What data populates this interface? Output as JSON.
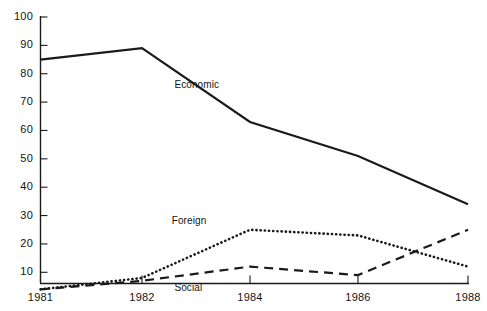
{
  "chart_data": {
    "type": "line",
    "title": "",
    "xlabel": "",
    "ylabel": "",
    "x": [
      1981,
      1982,
      1984,
      1986,
      1988
    ],
    "xlim": [
      1981,
      1988
    ],
    "ylim": [
      0,
      100
    ],
    "xticks": [
      "1981",
      "1982",
      "1984",
      "1986",
      "1988"
    ],
    "yticks": [
      "10",
      "20",
      "30",
      "40",
      "50",
      "60",
      "70",
      "80",
      "90",
      "100"
    ],
    "ytick_values": [
      10,
      20,
      30,
      40,
      50,
      60,
      70,
      80,
      90,
      100
    ],
    "grid": false,
    "legend": "inline-annotations",
    "series": [
      {
        "name": "Economic",
        "style": "solid",
        "color": "#1a1a1a",
        "values": [
          85,
          89,
          63,
          51,
          34
        ],
        "label_x": 1982.6,
        "label_y": 76
      },
      {
        "name": "Foreign",
        "style": "dotted",
        "color": "#1a1a1a",
        "values": [
          4,
          8,
          25,
          23,
          12
        ],
        "label_x": 1982.55,
        "label_y": 28
      },
      {
        "name": "Social",
        "style": "dashed",
        "color": "#1a1a1a",
        "values": [
          4,
          7,
          12,
          9,
          25
        ],
        "label_x": 1982.6,
        "label_y": 4.5
      }
    ],
    "annotations": [
      "Economic",
      "Foreign",
      "Social"
    ]
  },
  "axes": {
    "y_tick_labels": [
      "100",
      "90",
      "80",
      "70",
      "60",
      "50",
      "40",
      "30",
      "20",
      "10"
    ],
    "x_tick_labels": [
      "1981",
      "1982",
      "1984",
      "1986",
      "1988"
    ]
  },
  "colors": {
    "axis": "#1a1a1a",
    "series": "#1a1a1a",
    "background": "#ffffff"
  }
}
